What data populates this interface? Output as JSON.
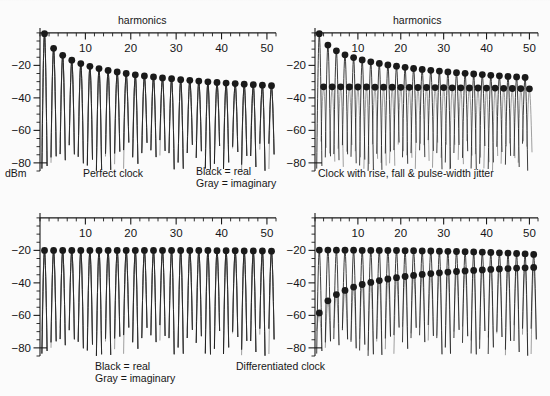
{
  "figure": {
    "axis_label_y": "dBm",
    "legend": {
      "real": "Black = real",
      "imaginary": "Gray = imaginary"
    }
  },
  "panels": [
    {
      "id": "top-left",
      "title_top": "harmonics",
      "caption": "Perfect clock",
      "legend_real": "Black = real",
      "legend_imag": "Gray = imaginary"
    },
    {
      "id": "top-right",
      "title_top": "harmonics",
      "caption": "Clock with rise, fall & pulse-width jitter"
    },
    {
      "id": "bottom-left",
      "caption": "",
      "legend_real": "Black = real",
      "legend_imag": "Gray = imaginary"
    },
    {
      "id": "bottom-right",
      "caption": "Differentiated clock"
    }
  ],
  "axes": {
    "x_ticks": [
      10,
      20,
      30,
      40,
      50
    ],
    "x_label": "harmonics",
    "x_min": 0,
    "x_max": 52,
    "x_minor_step": 2,
    "y_ticks": [
      -20,
      -40,
      -60,
      -80
    ],
    "y_label": "dBm",
    "y_min": -85,
    "y_max": 3,
    "y_minor_step": 5
  },
  "colors": {
    "real": "#1a1a1a",
    "imaginary": "#8e8e8e",
    "axis": "#1a1a1a",
    "background": "#fbfbfb"
  },
  "chart_data": [
    {
      "type": "line",
      "id": "top-left",
      "title": "Perfect clock",
      "xlabel": "harmonics",
      "ylabel": "dBm",
      "xlim": [
        0,
        52
      ],
      "ylim": [
        -85,
        3
      ],
      "grid": false,
      "legend": [
        "Black = real",
        "Gray = imaginary"
      ],
      "legend_position": "below-right",
      "markers": {
        "name": "real",
        "x": [
          1,
          3,
          5,
          7,
          9,
          11,
          13,
          15,
          17,
          19,
          21,
          23,
          25,
          27,
          29,
          31,
          33,
          35,
          37,
          39,
          41,
          43,
          45,
          47,
          49,
          51
        ],
        "y": [
          -0.5,
          -9.5,
          -13.8,
          -16.8,
          -18.9,
          -20.6,
          -22.0,
          -23.1,
          -24.1,
          -25.0,
          -25.8,
          -26.5,
          -27.1,
          -27.7,
          -28.2,
          -28.8,
          -29.2,
          -29.7,
          -30.1,
          -30.5,
          -30.9,
          -31.2,
          -31.6,
          -31.9,
          -32.2,
          -32.5
        ]
      },
      "envelope_note": "sinc-like 1/n roll-off on odd harmonics; nulls at even harmonics reaching below -80 dBm",
      "imaginary_series_note": "gray trace coincides with the black trace (imaginary part ~0 for perfect clock)"
    },
    {
      "type": "line",
      "id": "top-right",
      "title": "Clock with rise, fall & pulse-width jitter",
      "xlabel": "harmonics",
      "ylabel": "dBm",
      "xlim": [
        0,
        52
      ],
      "ylim": [
        -85,
        3
      ],
      "grid": false,
      "series": [
        {
          "name": "real",
          "x": [
            1,
            3,
            5,
            7,
            9,
            11,
            13,
            15,
            17,
            19,
            21,
            23,
            25,
            27,
            29,
            31,
            33,
            35,
            37,
            39,
            41,
            43,
            45,
            47,
            49
          ],
          "y": [
            -0.5,
            -7.5,
            -11.0,
            -13.5,
            -15.2,
            -16.6,
            -17.8,
            -18.8,
            -19.7,
            -20.5,
            -21.2,
            -21.9,
            -22.5,
            -23.0,
            -23.5,
            -24.0,
            -24.5,
            -24.9,
            -25.3,
            -25.7,
            -26.1,
            -26.4,
            -26.8,
            -27.1,
            -27.4
          ]
        },
        {
          "name": "imaginary",
          "x": [
            2,
            4,
            6,
            8,
            10,
            12,
            14,
            16,
            18,
            20,
            22,
            24,
            26,
            28,
            30,
            32,
            34,
            36,
            38,
            40,
            42,
            44,
            46,
            48,
            50
          ],
          "y": [
            -33.2,
            -33.2,
            -33.2,
            -33.3,
            -33.3,
            -33.3,
            -33.4,
            -33.4,
            -33.4,
            -33.5,
            -33.5,
            -33.6,
            -33.6,
            -33.7,
            -33.7,
            -33.8,
            -33.8,
            -33.9,
            -33.9,
            -34.0,
            -34.0,
            -34.1,
            -34.2,
            -34.3,
            -34.4
          ]
        }
      ],
      "annotation": "jitter raises a nearly flat noise-like imaginary floor near -33 dBm"
    },
    {
      "type": "line",
      "id": "bottom-left",
      "title": "",
      "xlabel": "harmonics",
      "ylabel": "dBm",
      "xlim": [
        0,
        52
      ],
      "ylim": [
        -85,
        3
      ],
      "grid": false,
      "legend": [
        "Black = real",
        "Gray = imaginary"
      ],
      "legend_position": "below",
      "markers": {
        "name": "real",
        "x": [
          1,
          3,
          5,
          7,
          9,
          11,
          13,
          15,
          17,
          19,
          21,
          23,
          25,
          27,
          29,
          31,
          33,
          35,
          37,
          39,
          41,
          43,
          45,
          47,
          49,
          51
        ],
        "y": [
          -20.0,
          -20.0,
          -20.0,
          -20.0,
          -20.0,
          -20.0,
          -20.0,
          -20.0,
          -20.0,
          -20.0,
          -20.0,
          -20.0,
          -20.0,
          -20.0,
          -20.0,
          -20.1,
          -20.1,
          -20.1,
          -20.1,
          -20.2,
          -20.2,
          -20.2,
          -20.3,
          -20.3,
          -20.4,
          -20.5
        ]
      },
      "envelope_note": "flat comb at -20 dBm; deep nulls between harmonics extend below -80 dBm"
    },
    {
      "type": "line",
      "id": "bottom-right",
      "title": "Differentiated clock",
      "xlabel": "harmonics",
      "ylabel": "dBm",
      "xlim": [
        0,
        52
      ],
      "ylim": [
        -85,
        3
      ],
      "grid": false,
      "series": [
        {
          "name": "real",
          "x": [
            1,
            3,
            5,
            7,
            9,
            11,
            13,
            15,
            17,
            19,
            21,
            23,
            25,
            27,
            29,
            31,
            33,
            35,
            37,
            39,
            41,
            43,
            45,
            47,
            49,
            51
          ],
          "y": [
            -19.8,
            -19.8,
            -19.9,
            -19.9,
            -19.9,
            -20.0,
            -20.0,
            -20.0,
            -20.1,
            -20.1,
            -20.2,
            -20.2,
            -20.3,
            -20.4,
            -20.5,
            -20.6,
            -20.7,
            -20.8,
            -21.0,
            -21.1,
            -21.3,
            -21.5,
            -21.7,
            -21.9,
            -22.2,
            -22.5
          ]
        },
        {
          "name": "imaginary",
          "x": [
            1,
            3,
            5,
            7,
            9,
            11,
            13,
            15,
            17,
            19,
            21,
            23,
            25,
            27,
            29,
            31,
            33,
            35,
            37,
            39,
            41,
            43,
            45,
            47,
            49,
            51
          ],
          "y": [
            -58.5,
            -51.0,
            -47.2,
            -44.6,
            -42.6,
            -41.0,
            -39.7,
            -38.6,
            -37.6,
            -36.8,
            -36.1,
            -35.4,
            -34.8,
            -34.3,
            -33.8,
            -33.4,
            -33.0,
            -32.6,
            -32.3,
            -32.0,
            -31.7,
            -31.4,
            -31.2,
            -30.9,
            -30.7,
            -30.5
          ]
        }
      ],
      "annotation": "imaginary component rises with harmonic number (differentiation tilts spectrum)"
    }
  ]
}
